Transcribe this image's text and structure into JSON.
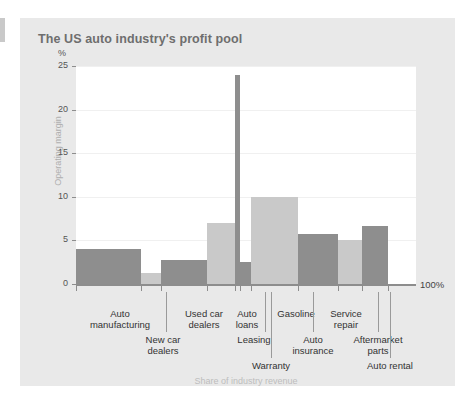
{
  "card": {
    "title": "The US auto industry's profit pool"
  },
  "axes": {
    "y_unit": "%",
    "y_title": "Operating margin",
    "y_ticks": [
      "0",
      "5",
      "10",
      "15",
      "20",
      "25"
    ],
    "x_title": "Share of industry revenue",
    "x_end_label": "100%"
  },
  "colors": {
    "card_background": "#e9e9e9",
    "plot_background": "#ffffff",
    "bar_dark": "#8e8e8e",
    "bar_light": "#c9c9c9",
    "axis": "#8d8d8d",
    "title_text": "#6e6e6e",
    "muted_text": "#bdbdbd"
  },
  "chart_data": {
    "type": "bar",
    "title": "The US auto industry's profit pool",
    "xlabel": "Share of industry revenue",
    "ylabel": "Operating margin",
    "yunit": "%",
    "ylim": [
      0,
      25
    ],
    "xlim": [
      0,
      100
    ],
    "grid": true,
    "note": "Marimekko-style chart: bar width encodes share of industry revenue, bar height encodes operating margin",
    "categories": [
      "Auto manufacturing",
      "New car dealers",
      "Used car dealers",
      "Auto loans",
      "Leasing",
      "Warranty",
      "Gasoline",
      "Service repair",
      "Aftermarket parts",
      "Auto rental"
    ],
    "values": [
      4.0,
      1.3,
      2.7,
      7.0,
      24.0,
      2.5,
      10.0,
      5.7,
      5.0,
      6.7
    ],
    "widths_pct": [
      19.1,
      5.9,
      13.5,
      8.2,
      1.5,
      3.2,
      13.8,
      11.8,
      7.1,
      7.6
    ],
    "series": [
      {
        "name": "Operating margin",
        "values": [
          4.0,
          1.3,
          2.7,
          7.0,
          24.0,
          2.5,
          10.0,
          5.7,
          5.0,
          6.7
        ]
      }
    ],
    "bars": [
      {
        "label": "Auto manufacturing",
        "margin": 4.0,
        "share_start": 0.0,
        "share_end": 19.1,
        "shade": "dark"
      },
      {
        "label": "New car dealers",
        "margin": 1.3,
        "share_start": 19.1,
        "share_end": 25.0,
        "shade": "light"
      },
      {
        "label": "Used car dealers",
        "margin": 2.7,
        "share_start": 25.0,
        "share_end": 38.5,
        "shade": "dark"
      },
      {
        "label": "Auto loans",
        "margin": 7.0,
        "share_start": 38.5,
        "share_end": 46.7,
        "shade": "light"
      },
      {
        "label": "Leasing",
        "margin": 24.0,
        "share_start": 46.7,
        "share_end": 48.2,
        "shade": "dark"
      },
      {
        "label": "Warranty",
        "margin": 2.5,
        "share_start": 48.2,
        "share_end": 51.4,
        "shade": "dark"
      },
      {
        "label": "Gasoline",
        "margin": 10.0,
        "share_start": 51.4,
        "share_end": 65.2,
        "shade": "light"
      },
      {
        "label": "Service repair",
        "margin": 5.7,
        "share_start": 65.2,
        "share_end": 77.0,
        "shade": "dark"
      },
      {
        "label": "Aftermarket parts",
        "margin": 5.0,
        "share_start": 77.0,
        "share_end": 84.1,
        "shade": "light"
      },
      {
        "label": "Auto rental",
        "margin": 6.7,
        "share_start": 84.1,
        "share_end": 91.7,
        "shade": "dark"
      }
    ]
  },
  "category_labels": [
    {
      "line1": "Auto",
      "line2": "manufacturing"
    },
    {
      "line1": "New car",
      "line2": "dealers"
    },
    {
      "line1": "Used car",
      "line2": "dealers"
    },
    {
      "line1": "Auto",
      "line2": "loans"
    },
    {
      "line1": "Leasing",
      "line2": ""
    },
    {
      "line1": "Warranty",
      "line2": ""
    },
    {
      "line1": "Gasoline",
      "line2": ""
    },
    {
      "line1": "Service",
      "line2": "repair"
    },
    {
      "line1": "Auto",
      "line2": "insurance"
    },
    {
      "line1": "Aftermarket",
      "line2": "parts"
    },
    {
      "line1": "Auto rental",
      "line2": ""
    }
  ]
}
